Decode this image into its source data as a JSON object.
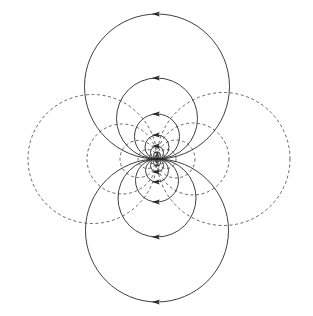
{
  "figure": {
    "width": 313,
    "height": 316,
    "background_color": "#ffffff"
  },
  "chart_data": {
    "type": "scatter",
    "title": "",
    "subtitle": "",
    "xlabel": "",
    "ylabel": "",
    "grid": false,
    "legend_position": "none",
    "xlim": [
      0,
      313
    ],
    "ylim": [
      0,
      316
    ],
    "origin": {
      "x": 157,
      "y": 159,
      "label": "dipole-center"
    },
    "series": [
      {
        "name": "field-lines-solid-upper",
        "style": "solid",
        "color": "#2a2a2a",
        "orientation": "vertical-tangent-at-origin",
        "circles": [
          {
            "cx": 157,
            "cy": 86.5,
            "r": 72.5,
            "arrow": "left",
            "arrow_at": "top"
          },
          {
            "cx": 157,
            "cy": 118.5,
            "r": 40.5,
            "arrow": "left",
            "arrow_at": "top"
          },
          {
            "cx": 157,
            "cy": 136.5,
            "r": 22.5,
            "arrow": "left",
            "arrow_at": "top"
          },
          {
            "cx": 157,
            "cy": 147.0,
            "r": 12.0,
            "arrow": "left",
            "arrow_at": "top"
          },
          {
            "cx": 157,
            "cy": 152.5,
            "r": 6.5,
            "arrow": "left",
            "arrow_at": "top"
          },
          {
            "cx": 157,
            "cy": 155.5,
            "r": 3.5,
            "arrow": "left",
            "arrow_at": "top"
          },
          {
            "cx": 157,
            "cy": 157.2,
            "r": 1.8,
            "arrow": "none",
            "arrow_at": "top"
          }
        ]
      },
      {
        "name": "field-lines-solid-lower",
        "style": "solid",
        "color": "#2a2a2a",
        "orientation": "vertical-tangent-at-origin",
        "circles": [
          {
            "cx": 157,
            "cy": 230.5,
            "r": 71.5,
            "arrow": "left",
            "arrow_at": "bottom"
          },
          {
            "cx": 157,
            "cy": 198.0,
            "r": 39.0,
            "arrow": "left",
            "arrow_at": "bottom"
          },
          {
            "cx": 157,
            "cy": 180.5,
            "r": 21.5,
            "arrow": "left",
            "arrow_at": "bottom"
          },
          {
            "cx": 157,
            "cy": 170.5,
            "r": 11.5,
            "arrow": "left",
            "arrow_at": "bottom"
          },
          {
            "cx": 157,
            "cy": 165.5,
            "r": 6.5,
            "arrow": "left",
            "arrow_at": "bottom"
          },
          {
            "cx": 157,
            "cy": 162.5,
            "r": 3.5,
            "arrow": "left",
            "arrow_at": "bottom"
          },
          {
            "cx": 157,
            "cy": 160.8,
            "r": 1.8,
            "arrow": "none",
            "arrow_at": "bottom"
          }
        ]
      },
      {
        "name": "equipotential-circles-dashed-left",
        "style": "dashed",
        "color": "#4a4a4a",
        "orientation": "horizontal-tangent-at-origin",
        "circles": [
          {
            "cx": 92.5,
            "cy": 159,
            "r": 64.5
          },
          {
            "cx": 122.0,
            "cy": 159,
            "r": 35.0
          },
          {
            "cx": 138.5,
            "cy": 159,
            "r": 18.5
          },
          {
            "cx": 147.5,
            "cy": 159,
            "r": 9.5
          },
          {
            "cx": 152.5,
            "cy": 159,
            "r": 4.5
          },
          {
            "cx": 155.0,
            "cy": 159,
            "r": 2.0
          }
        ]
      },
      {
        "name": "equipotential-circles-dashed-right",
        "style": "dashed",
        "color": "#4a4a4a",
        "orientation": "horizontal-tangent-at-origin",
        "circles": [
          {
            "cx": 223.5,
            "cy": 159,
            "r": 66.5
          },
          {
            "cx": 193.0,
            "cy": 159,
            "r": 36.0
          },
          {
            "cx": 176.0,
            "cy": 159,
            "r": 19.0
          },
          {
            "cx": 166.5,
            "cy": 159,
            "r": 9.5
          },
          {
            "cx": 161.5,
            "cy": 159,
            "r": 4.5
          },
          {
            "cx": 159.0,
            "cy": 159,
            "r": 2.0
          }
        ]
      }
    ],
    "annotations": [
      {
        "type": "arrowhead",
        "direction": "left",
        "x": 157,
        "y": 14,
        "note": "top of largest solid circle"
      },
      {
        "type": "arrowhead",
        "direction": "left",
        "x": 157,
        "y": 78,
        "note": "top of second solid circle"
      },
      {
        "type": "arrowhead",
        "direction": "left",
        "x": 157,
        "y": 114,
        "note": "top of third solid circle"
      },
      {
        "type": "arrowhead",
        "direction": "left",
        "x": 157,
        "y": 135,
        "note": "top of fourth solid circle"
      },
      {
        "type": "arrowhead",
        "direction": "left",
        "x": 157,
        "y": 146,
        "note": "top of fifth solid circle"
      },
      {
        "type": "arrowhead",
        "direction": "left",
        "x": 157,
        "y": 302,
        "note": "bottom of largest solid circle"
      },
      {
        "type": "arrowhead",
        "direction": "left",
        "x": 157,
        "y": 237,
        "note": "bottom of second solid circle"
      },
      {
        "type": "arrowhead",
        "direction": "left",
        "x": 157,
        "y": 202,
        "note": "bottom of third solid circle"
      },
      {
        "type": "arrowhead",
        "direction": "left",
        "x": 157,
        "y": 182,
        "note": "bottom of fourth solid circle"
      },
      {
        "type": "arrowhead",
        "direction": "left",
        "x": 157,
        "y": 172,
        "note": "bottom of fifth solid circle"
      }
    ]
  }
}
